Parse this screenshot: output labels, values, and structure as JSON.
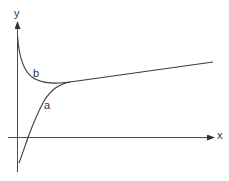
{
  "figure": {
    "axes": {
      "x_label": "x",
      "y_label": "y"
    },
    "curves": [
      {
        "name": "a",
        "label": "a",
        "description": "rises from below x-axis, crosses it, then asymptotically merges with the straight line"
      },
      {
        "name": "b",
        "label": "b",
        "description": "falls from high near y-axis, dips to a minimum, then merges with the same straight line"
      }
    ],
    "asymptote": {
      "description": "shared rising straight line both curves converge to"
    },
    "colors": {
      "line": "#3a3a3a",
      "axis": "#4a4a4a",
      "background": "#ffffff"
    }
  }
}
